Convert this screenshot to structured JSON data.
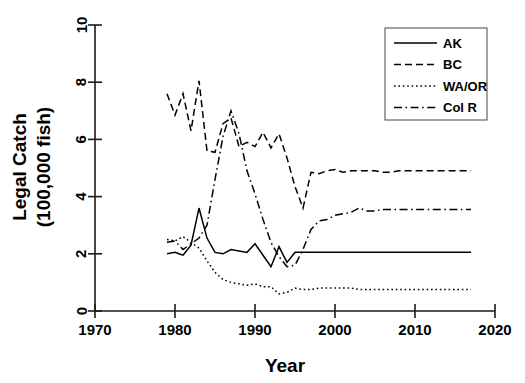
{
  "chart_data": {
    "type": "line",
    "title": "",
    "xlabel": "Year",
    "ylabel": "Legal Catch\n(100,000 fish)",
    "ylabel_line1": "Legal Catch",
    "ylabel_line2": "(100,000 fish)",
    "xlim": [
      1970,
      2020
    ],
    "ylim": [
      0,
      10
    ],
    "xticks": [
      1970,
      1980,
      1990,
      2000,
      2010,
      2020
    ],
    "xtick_labels": [
      "1970",
      "1980",
      "1990",
      "2000",
      "2010",
      "2020"
    ],
    "yticks": [
      0,
      2,
      4,
      6,
      8,
      10
    ],
    "ytick_labels": [
      "0",
      "2",
      "4",
      "6",
      "8",
      "10"
    ],
    "grid": false,
    "legend_position": "top-right",
    "legend_entries": [
      "AK",
      "BC",
      "WA/OR",
      "Col R"
    ],
    "x": [
      1979,
      1980,
      1981,
      1982,
      1983,
      1984,
      1985,
      1986,
      1987,
      1988,
      1989,
      1990,
      1991,
      1992,
      1993,
      1994,
      1995,
      1996,
      1997,
      1998,
      1999,
      2000,
      2001,
      2002,
      2003,
      2004,
      2005,
      2006,
      2007,
      2008,
      2009,
      2010,
      2011,
      2012,
      2013,
      2014,
      2015,
      2016,
      2017
    ],
    "series": [
      {
        "name": "AK",
        "dash": "solid",
        "values": [
          2.0,
          2.05,
          1.95,
          2.3,
          3.6,
          2.55,
          2.05,
          2.0,
          2.15,
          2.1,
          2.05,
          2.35,
          1.95,
          1.55,
          2.25,
          1.7,
          2.05,
          2.05,
          2.05,
          2.05,
          2.05,
          2.05,
          2.05,
          2.05,
          2.05,
          2.05,
          2.05,
          2.05,
          2.05,
          2.05,
          2.05,
          2.05,
          2.05,
          2.05,
          2.05,
          2.05,
          2.05,
          2.05,
          2.05
        ]
      },
      {
        "name": "BC",
        "dash": "dashed",
        "values": [
          7.6,
          6.85,
          7.6,
          6.3,
          8.05,
          5.6,
          5.55,
          6.55,
          6.75,
          5.75,
          5.9,
          5.75,
          6.25,
          5.7,
          6.2,
          5.35,
          4.35,
          3.6,
          4.85,
          4.8,
          4.9,
          4.95,
          4.85,
          4.9,
          4.9,
          4.9,
          4.9,
          4.85,
          4.85,
          4.9,
          4.9,
          4.9,
          4.9,
          4.9,
          4.9,
          4.9,
          4.9,
          4.9,
          4.9
        ]
      },
      {
        "name": "WA/OR",
        "dash": "dotted",
        "values": [
          2.5,
          2.45,
          2.6,
          2.4,
          2.2,
          1.75,
          1.35,
          1.1,
          1.0,
          0.95,
          0.9,
          0.95,
          0.85,
          0.85,
          0.6,
          0.65,
          0.8,
          0.75,
          0.75,
          0.8,
          0.8,
          0.8,
          0.8,
          0.8,
          0.75,
          0.75,
          0.75,
          0.75,
          0.75,
          0.75,
          0.75,
          0.75,
          0.75,
          0.75,
          0.75,
          0.75,
          0.75,
          0.75,
          0.75
        ]
      },
      {
        "name": "Col R",
        "dash": "dashdot",
        "values": [
          2.4,
          2.45,
          2.15,
          2.35,
          2.55,
          3.0,
          4.6,
          6.1,
          7.0,
          6.2,
          4.9,
          4.1,
          3.2,
          2.4,
          1.9,
          1.55,
          1.6,
          2.15,
          2.85,
          3.15,
          3.2,
          3.35,
          3.4,
          3.45,
          3.6,
          3.5,
          3.5,
          3.55,
          3.55,
          3.55,
          3.55,
          3.55,
          3.55,
          3.55,
          3.55,
          3.55,
          3.55,
          3.55,
          3.55
        ]
      }
    ]
  },
  "axes": {
    "x_title": "Year",
    "y_title_line1": "Legal Catch",
    "y_title_line2": "(100,000 fish)"
  },
  "legend": {
    "items": [
      {
        "label": "AK",
        "dash": "solid"
      },
      {
        "label": "BC",
        "dash": "dashed"
      },
      {
        "label": "WA/OR",
        "dash": "dotted"
      },
      {
        "label": "Col R",
        "dash": "dashdot"
      }
    ]
  },
  "colors": {
    "line": "#000000",
    "axis": "#1a1a1a",
    "background": "#ffffff",
    "legend_border": "#555555"
  }
}
